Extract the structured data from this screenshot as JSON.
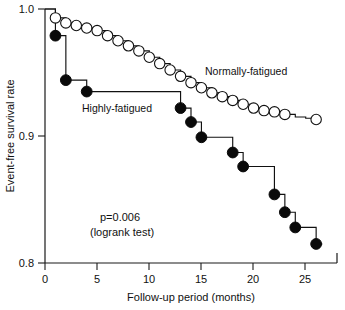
{
  "chart_data": {
    "type": "line",
    "title": "",
    "subtitle": "",
    "xlabel": "Follow-up period (months)",
    "ylabel": "Event-free survival rate",
    "xlim": [
      0,
      28
    ],
    "ylim": [
      0.8,
      1.0
    ],
    "xticks": [
      0,
      5,
      10,
      15,
      20,
      25
    ],
    "xticklabels": [
      "0",
      "5",
      "10",
      "15",
      "20",
      "25"
    ],
    "yticks": [
      0.8,
      0.9,
      1.0
    ],
    "yticklabels": [
      "0.8",
      "0.9",
      "1.0"
    ],
    "grid": false,
    "legend_position": "inline-annotation",
    "plot_kind": "kaplan-meier-step",
    "series": [
      {
        "name": "Normally-fatigued",
        "marker": "open-circle",
        "label_text": "Normally-fatigued",
        "x": [
          0,
          1,
          2,
          3,
          4,
          5,
          6,
          7,
          8,
          9,
          10,
          11,
          12,
          13,
          14,
          15,
          16,
          17,
          18,
          19,
          20,
          21,
          22,
          23,
          24,
          25,
          26
        ],
        "y": [
          1.0,
          0.993,
          0.989,
          0.987,
          0.985,
          0.983,
          0.979,
          0.975,
          0.971,
          0.967,
          0.962,
          0.957,
          0.952,
          0.947,
          0.942,
          0.938,
          0.934,
          0.931,
          0.928,
          0.925,
          0.922,
          0.92,
          0.919,
          0.917,
          0.915,
          0.914,
          0.913
        ],
        "censor_marks_x": [
          1,
          2,
          3,
          4,
          5,
          6,
          7,
          8,
          9,
          10,
          11,
          12,
          13,
          14,
          15,
          16,
          17,
          18,
          19,
          20,
          21,
          22,
          23,
          26
        ],
        "final_value": 0.913
      },
      {
        "name": "Highly-fatigued",
        "marker": "filled-circle",
        "label_text": "Highly-fatigued",
        "x": [
          0,
          1,
          2,
          4,
          13,
          14,
          15,
          18,
          19,
          22,
          23,
          24,
          26
        ],
        "y": [
          1.0,
          0.979,
          0.944,
          0.935,
          0.922,
          0.911,
          0.899,
          0.887,
          0.876,
          0.854,
          0.84,
          0.828,
          0.815
        ],
        "event_marks_x": [
          1,
          2,
          4,
          13,
          14,
          15,
          18,
          19,
          22,
          23,
          24,
          26
        ],
        "final_value": 0.815
      }
    ],
    "annotations": [
      {
        "name": "p-value",
        "text": "p=0.006",
        "x": 10.0,
        "y": 0.829
      },
      {
        "name": "test-name",
        "text": "(logrank test)",
        "x": 10.0,
        "y": 0.819
      }
    ]
  },
  "labels": {
    "y_axis_title": "Event-free survival rate",
    "x_axis_title": "Follow-up period (months)",
    "series_normal": "Normally-fatigued",
    "series_high": "Highly-fatigued",
    "pvalue": "p=0.006",
    "test": "(logrank test)",
    "ytick_top": "1.0",
    "ytick_mid": "0.9",
    "ytick_bottom": "0.8",
    "xtick_0": "0",
    "xtick_5": "5",
    "xtick_10": "10",
    "xtick_15": "15",
    "xtick_20": "20",
    "xtick_25": "25"
  },
  "colors": {
    "axis": "#1a1a1a",
    "curve": "#111111",
    "open_marker_fill": "#ffffff",
    "closed_marker_fill": "#0a0a0a",
    "background": "#ffffff"
  }
}
